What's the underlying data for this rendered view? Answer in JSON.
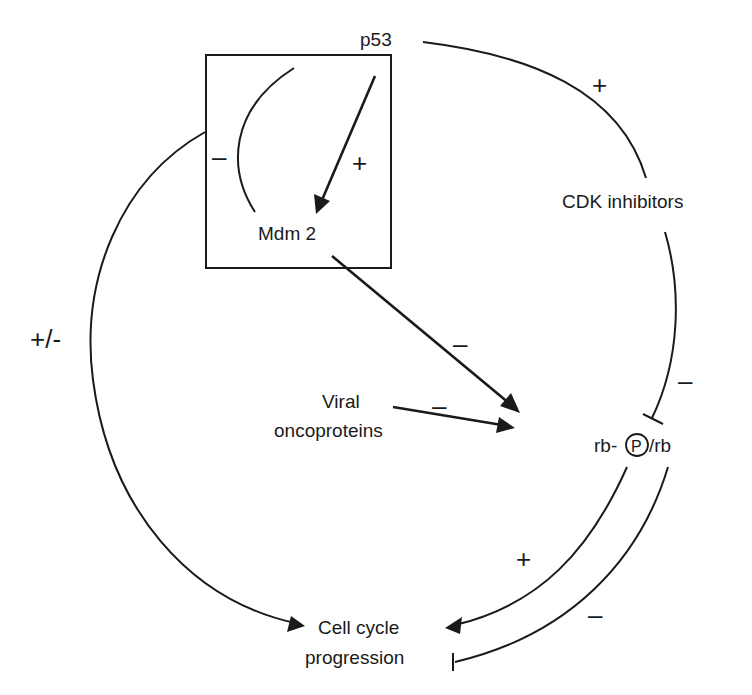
{
  "colors": {
    "ink": "#1a1a1a",
    "background": "#ffffff"
  },
  "nodes": {
    "p53": "p53",
    "mdm2": "Mdm 2",
    "cdk_inhibitors": "CDK inhibitors",
    "viral_line1": "Viral",
    "viral_line2": "oncoproteins",
    "rb_prefix": "rb-",
    "rb_phospho_symbol": "P",
    "rb_suffix": "/rb",
    "cell_cycle_line1": "Cell cycle",
    "cell_cycle_line2": "progression"
  },
  "edges": [
    {
      "from": "p53",
      "to": "Mdm 2",
      "sign": "+",
      "type": "activation"
    },
    {
      "from": "Mdm 2",
      "to": "p53",
      "sign": "–",
      "type": "inhibition"
    },
    {
      "from": "p53",
      "to": "CDK inhibitors",
      "sign": "+",
      "type": "activation"
    },
    {
      "from": "CDK inhibitors",
      "to": "rb-P/rb",
      "sign": "–",
      "type": "inhibition"
    },
    {
      "from": "Mdm 2",
      "to": "rb-P/rb",
      "sign": "–",
      "type": "activation-arrow"
    },
    {
      "from": "Viral oncoproteins",
      "to": "rb-P/rb",
      "sign": "–",
      "type": "activation-arrow"
    },
    {
      "from": "rb-P/rb",
      "to": "Cell cycle progression",
      "sign": "+",
      "type": "activation"
    },
    {
      "from": "rb-P/rb",
      "to": "Cell cycle progression",
      "sign": "–",
      "type": "inhibition"
    },
    {
      "from": "p53/Mdm2 box",
      "to": "Cell cycle progression",
      "sign": "+/-",
      "type": "activation"
    }
  ],
  "signs": {
    "mdm2_to_p53": "–",
    "p53_to_mdm2": "+",
    "p53_to_cdk": "+",
    "cdk_to_rb": "–",
    "mdm2_to_rb": "–",
    "viral_to_rb": "–",
    "rb_to_cell_plus": "+",
    "rb_to_cell_minus": "–",
    "box_to_cell": "+/-"
  }
}
